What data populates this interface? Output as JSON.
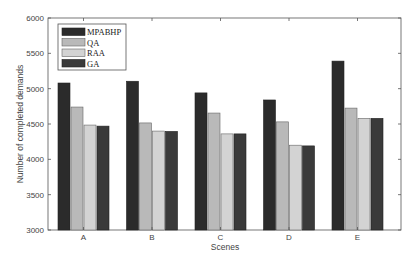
{
  "chart_data": {
    "type": "bar",
    "title": "",
    "xlabel": "Scenes",
    "ylabel": "Number of completed demands",
    "ylim": [
      3000,
      6000
    ],
    "yticks": [
      3000,
      3500,
      4000,
      4500,
      5000,
      5500,
      6000
    ],
    "categories": [
      "A",
      "B",
      "C",
      "D",
      "E"
    ],
    "grid": false,
    "legend_position": "upper left",
    "series": [
      {
        "name": "MPABHP",
        "color": "#2b2b2b",
        "values": [
          5080,
          5105,
          4940,
          4840,
          5390
        ]
      },
      {
        "name": "QA",
        "color": "#b9b9b9",
        "values": [
          4740,
          4515,
          4655,
          4530,
          4725
        ]
      },
      {
        "name": "RAA",
        "color": "#d3d3d3",
        "values": [
          4485,
          4400,
          4360,
          4200,
          4580
        ]
      },
      {
        "name": "GA",
        "color": "#3a3a3a",
        "values": [
          4470,
          4395,
          4360,
          4190,
          4580
        ]
      }
    ]
  }
}
